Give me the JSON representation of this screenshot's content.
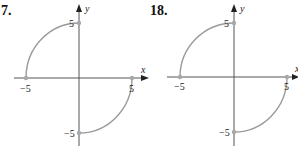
{
  "figures": [
    {
      "number": "7.",
      "x_axis_label": "x",
      "y_axis_label": "y",
      "ticks": {
        "x_pos": "5",
        "x_neg": "−5",
        "y_pos": "5",
        "y_neg": "−5"
      },
      "description": "Two quarter-circle arcs of radius 5: upper-left quadrant from (-5,0) to (0,5) and lower-right quadrant from (5,0) to (0,-5)"
    },
    {
      "number": "18.",
      "x_axis_label": "x",
      "y_axis_label": "y",
      "ticks": {
        "x_pos": "5",
        "x_neg": "−5",
        "y_pos": "5",
        "y_neg": "−5"
      },
      "description": "Two quarter-circle arcs of radius 5: upper-left quadrant from (-5,0) to (0,5) and lower-right quadrant from (5,0) to (0,-5)"
    }
  ],
  "colors": {
    "axis": "#555555",
    "curve": "#9a9a9a",
    "text": "#111111"
  }
}
